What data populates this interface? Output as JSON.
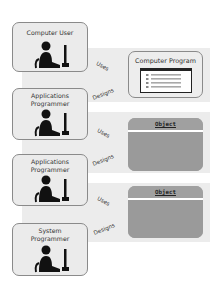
{
  "diagram": {
    "actors": [
      {
        "id": "computer-user",
        "label": "Computer User"
      },
      {
        "id": "applications-programmer-1",
        "label": "Applications\nProgrammer"
      },
      {
        "id": "applications-programmer-2",
        "label": "Applications\nProgrammer"
      },
      {
        "id": "system-programmer",
        "label": "System\nProgrammer"
      }
    ],
    "targets": {
      "computer_program": {
        "label": "Computer Program"
      },
      "object_1": {
        "label": "Object"
      },
      "object_2": {
        "label": "Object"
      }
    },
    "relations": [
      {
        "from": "Computer User",
        "to": "Computer Program",
        "label": "Uses"
      },
      {
        "from": "Applications Programmer",
        "to": "Computer Program",
        "label": "Designs"
      },
      {
        "from": "Applications Programmer",
        "to": "Object",
        "label": "Uses"
      },
      {
        "from": "Applications Programmer",
        "to": "Object",
        "label": "Designs"
      },
      {
        "from": "Applications Programmer",
        "to": "Object",
        "label": "Uses"
      },
      {
        "from": "System Programmer",
        "to": "Object",
        "label": "Designs"
      }
    ],
    "colors": {
      "band": "#ececec",
      "actor_fill": "#ebebeb",
      "border": "#8a8a8a",
      "object_fill": "#9a9a9a",
      "figure": "#111111"
    }
  }
}
